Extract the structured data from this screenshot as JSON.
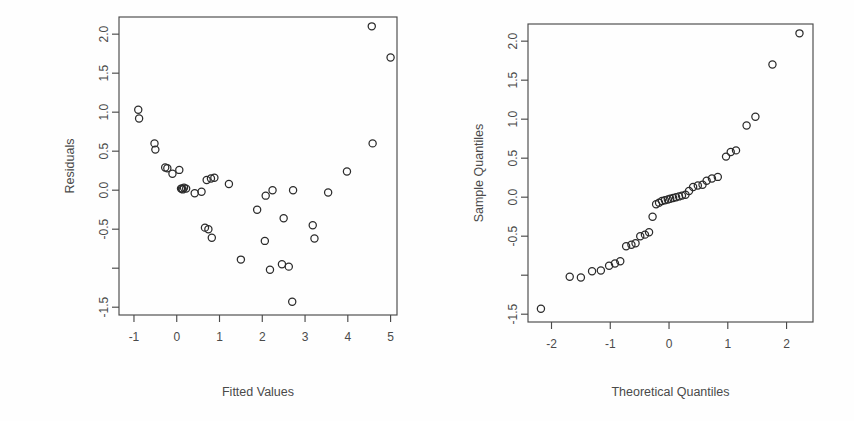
{
  "figure": {
    "title": "",
    "background_color": "#fefefe",
    "point_color": "#2b2b2b",
    "axis_color": "#4a4a4a"
  },
  "chart_data": [
    {
      "type": "scatter",
      "panel": "left",
      "title": "",
      "xlabel": "Fitted Values",
      "ylabel": "Residuals",
      "xlim": [
        -1.35,
        5.15
      ],
      "ylim": [
        -1.6,
        2.22
      ],
      "grid": false,
      "legend": null,
      "xticks": [
        -1,
        0,
        1,
        2,
        3,
        4,
        5
      ],
      "xtick_labels": [
        "-1",
        "0",
        "1",
        "2",
        "3",
        "4",
        "5"
      ],
      "yticks": [
        -1.5,
        -1.0,
        -0.5,
        0.0,
        0.5,
        1.0,
        1.5,
        2.0
      ],
      "ytick_labels": [
        "-1.5",
        "",
        "-0.5",
        "0.0",
        "0.5",
        "1.0",
        "1.5",
        "2.0"
      ],
      "x": [
        -0.9,
        -0.88,
        -0.52,
        -0.5,
        -0.27,
        -0.22,
        -0.1,
        0.06,
        0.1,
        0.12,
        0.14,
        0.17,
        0.22,
        0.42,
        0.58,
        0.66,
        0.7,
        0.74,
        0.8,
        0.82,
        0.88,
        1.22,
        1.5,
        1.88,
        2.06,
        2.08,
        2.18,
        2.24,
        2.46,
        2.5,
        2.62,
        2.7,
        2.72,
        3.18,
        3.22,
        3.54,
        3.98,
        4.56,
        4.58,
        5.0
      ],
      "y": [
        1.03,
        0.92,
        0.6,
        0.52,
        0.29,
        0.28,
        0.21,
        0.26,
        0.02,
        0.02,
        0.01,
        0.03,
        0.02,
        -0.04,
        -0.02,
        -0.48,
        0.13,
        -0.5,
        0.15,
        -0.61,
        0.16,
        0.08,
        -0.89,
        -0.25,
        -0.65,
        -0.07,
        -1.02,
        0.0,
        -0.95,
        -0.36,
        -0.98,
        -1.43,
        0.0,
        -0.45,
        -0.62,
        -0.03,
        0.24,
        2.1,
        0.6,
        1.7
      ]
    },
    {
      "type": "scatter",
      "panel": "right",
      "title": "",
      "xlabel": "Theoretical Quantiles",
      "ylabel": "Sample Quantiles",
      "xlim": [
        -2.4,
        2.45
      ],
      "ylim": [
        -1.6,
        2.22
      ],
      "grid": false,
      "legend": null,
      "xticks": [
        -2,
        -1,
        0,
        1,
        2
      ],
      "xtick_labels": [
        "-2",
        "-1",
        "0",
        "1",
        "2"
      ],
      "yticks": [
        -1.5,
        -1.0,
        -0.5,
        0.0,
        0.5,
        1.0,
        1.5,
        2.0
      ],
      "ytick_labels": [
        "-1.5",
        "",
        "-0.5",
        "0.0",
        "0.5",
        "1.0",
        "1.5",
        "2.0"
      ],
      "x": [
        -2.18,
        -1.69,
        -1.5,
        -1.31,
        -1.16,
        -1.02,
        -0.92,
        -0.83,
        -0.73,
        -0.64,
        -0.57,
        -0.49,
        -0.41,
        -0.34,
        -0.28,
        -0.22,
        -0.17,
        -0.12,
        -0.07,
        -0.02,
        0.02,
        0.07,
        0.12,
        0.17,
        0.22,
        0.28,
        0.34,
        0.41,
        0.49,
        0.57,
        0.64,
        0.73,
        0.83,
        0.97,
        1.05,
        1.14,
        1.32,
        1.47,
        1.76,
        2.22
      ],
      "y": [
        -1.43,
        -1.02,
        -1.03,
        -0.95,
        -0.94,
        -0.88,
        -0.85,
        -0.82,
        -0.63,
        -0.61,
        -0.59,
        -0.5,
        -0.48,
        -0.45,
        -0.25,
        -0.09,
        -0.07,
        -0.05,
        -0.04,
        -0.03,
        -0.02,
        -0.01,
        0.0,
        0.01,
        0.02,
        0.03,
        0.08,
        0.13,
        0.15,
        0.16,
        0.21,
        0.24,
        0.26,
        0.52,
        0.58,
        0.6,
        0.92,
        1.03,
        1.7,
        2.1
      ]
    }
  ]
}
